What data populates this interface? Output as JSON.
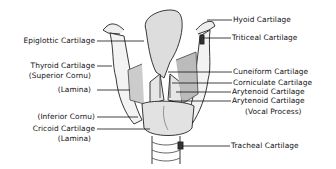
{
  "diagram": {
    "left_labels": [
      {
        "id": "epiglottic",
        "text": "Epiglottic Cartilage"
      },
      {
        "id": "thyroid",
        "text": "Thyroid Cartilage"
      },
      {
        "id": "thyroid_sup",
        "text": "(Superior Cornu)"
      },
      {
        "id": "thyroid_lamina",
        "text": "(Lamina)"
      },
      {
        "id": "inferior_cornu",
        "text": "(Inferior Cornu)"
      },
      {
        "id": "cricoid",
        "text": "Cricoid Cartilage"
      },
      {
        "id": "cricoid_lamina",
        "text": "(Lamina)"
      }
    ],
    "right_labels": [
      {
        "id": "hyoid",
        "text": "Hyoid Cartilage"
      },
      {
        "id": "triticeal",
        "text": "Triticeal Cartilage"
      },
      {
        "id": "cuneiform",
        "text": "Cuneiform Cartilage"
      },
      {
        "id": "corniculate",
        "text": "Corniculate Cartilage"
      },
      {
        "id": "arytenoid",
        "text": "Arytenoid Cartilage"
      },
      {
        "id": "arytenoid_vp",
        "text": "Arytenoid Cartilage"
      },
      {
        "id": "vocal_process",
        "text": "(Vocal Process)"
      },
      {
        "id": "tracheal",
        "text": "Tracheal Cartilage"
      }
    ]
  }
}
